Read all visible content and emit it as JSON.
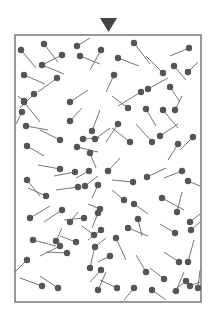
{
  "diagram": {
    "colors": {
      "head": "#555555",
      "tail": "#666666",
      "frame": "#777777",
      "arrow": "#444444",
      "background": "#ffffff"
    },
    "arrow": {
      "points": "100,18 117,18 108.5,32"
    },
    "frame": {
      "x": 15,
      "y": 35,
      "width": 186,
      "height": 267
    },
    "molecules": [
      [
        21,
        50,
        36,
        68
      ],
      [
        44,
        44,
        58,
        62
      ],
      [
        62,
        55,
        44,
        64
      ],
      [
        42,
        65,
        64,
        74
      ],
      [
        77,
        46,
        90,
        38
      ],
      [
        80,
        56,
        100,
        64
      ],
      [
        101,
        50,
        90,
        70
      ],
      [
        24,
        75,
        45,
        84
      ],
      [
        57,
        78,
        38,
        92
      ],
      [
        34,
        94,
        20,
        108
      ],
      [
        24,
        101,
        18,
        96
      ],
      [
        134,
        43,
        150,
        64
      ],
      [
        118,
        58,
        139,
        66
      ],
      [
        189,
        48,
        170,
        56
      ],
      [
        163,
        73,
        146,
        56
      ],
      [
        174,
        66,
        186,
        80
      ],
      [
        188,
        72,
        198,
        62
      ],
      [
        114,
        75,
        106,
        92
      ],
      [
        141,
        92,
        118,
        106
      ],
      [
        148,
        89,
        168,
        78
      ],
      [
        170,
        87,
        180,
        102
      ],
      [
        24,
        102,
        40,
        122
      ],
      [
        22,
        112,
        16,
        124
      ],
      [
        26,
        126,
        48,
        130
      ],
      [
        60,
        140,
        40,
        130
      ],
      [
        83,
        139,
        100,
        138
      ],
      [
        92,
        131,
        100,
        110
      ],
      [
        70,
        102,
        88,
        90
      ],
      [
        70,
        121,
        82,
        108
      ],
      [
        128,
        108,
        112,
        96
      ],
      [
        146,
        109,
        156,
        126
      ],
      [
        163,
        110,
        178,
        128
      ],
      [
        175,
        110,
        182,
        96
      ],
      [
        118,
        124,
        106,
        142
      ],
      [
        130,
        142,
        112,
        128
      ],
      [
        152,
        142,
        136,
        124
      ],
      [
        160,
        136,
        178,
        124
      ],
      [
        178,
        144,
        168,
        160
      ],
      [
        193,
        137,
        180,
        150
      ],
      [
        27,
        146,
        44,
        156
      ],
      [
        77,
        147,
        98,
        152
      ],
      [
        90,
        153,
        96,
        168
      ],
      [
        95,
        139,
        110,
        128
      ],
      [
        60,
        169,
        38,
        165
      ],
      [
        75,
        172,
        54,
        176
      ],
      [
        89,
        171,
        76,
        178
      ],
      [
        27,
        180,
        40,
        196
      ],
      [
        46,
        196,
        28,
        188
      ],
      [
        78,
        187,
        56,
        190
      ],
      [
        85,
        186,
        98,
        176
      ],
      [
        98,
        185,
        92,
        198
      ],
      [
        100,
        209,
        88,
        204
      ],
      [
        108,
        171,
        120,
        158
      ],
      [
        133,
        182,
        112,
        180
      ],
      [
        147,
        177,
        166,
        168
      ],
      [
        182,
        171,
        164,
        178
      ],
      [
        188,
        181,
        200,
        186
      ],
      [
        30,
        218,
        50,
        206
      ],
      [
        62,
        210,
        44,
        222
      ],
      [
        70,
        222,
        78,
        212
      ],
      [
        84,
        218,
        64,
        220
      ],
      [
        98,
        213,
        92,
        228
      ],
      [
        124,
        200,
        112,
        190
      ],
      [
        134,
        204,
        148,
        214
      ],
      [
        138,
        219,
        142,
        236
      ],
      [
        162,
        198,
        184,
        210
      ],
      [
        177,
        212,
        182,
        192
      ],
      [
        190,
        222,
        200,
        214
      ],
      [
        101,
        230,
        88,
        240
      ],
      [
        76,
        242,
        60,
        236
      ],
      [
        94,
        235,
        82,
        226
      ],
      [
        56,
        241,
        62,
        228
      ],
      [
        33,
        240,
        56,
        246
      ],
      [
        60,
        246,
        40,
        256
      ],
      [
        67,
        253,
        46,
        252
      ],
      [
        95,
        247,
        106,
        238
      ],
      [
        90,
        268,
        94,
        250
      ],
      [
        101,
        270,
        90,
        282
      ],
      [
        128,
        228,
        148,
        236
      ],
      [
        116,
        238,
        126,
        260
      ],
      [
        175,
        233,
        160,
        224
      ],
      [
        191,
        230,
        200,
        222
      ],
      [
        110,
        256,
        98,
        262
      ],
      [
        146,
        272,
        136,
        255
      ],
      [
        164,
        279,
        150,
        268
      ],
      [
        179,
        262,
        164,
        252
      ],
      [
        188,
        262,
        194,
        240
      ],
      [
        198,
        288,
        200,
        270
      ],
      [
        27,
        260,
        15,
        272
      ],
      [
        42,
        286,
        20,
        278
      ],
      [
        58,
        288,
        40,
        276
      ],
      [
        98,
        290,
        106,
        272
      ],
      [
        117,
        288,
        100,
        280
      ],
      [
        134,
        288,
        124,
        300
      ],
      [
        152,
        290,
        166,
        300
      ],
      [
        176,
        291,
        184,
        272
      ],
      [
        190,
        286,
        200,
        282
      ],
      [
        186,
        281,
        172,
        292
      ]
    ]
  }
}
